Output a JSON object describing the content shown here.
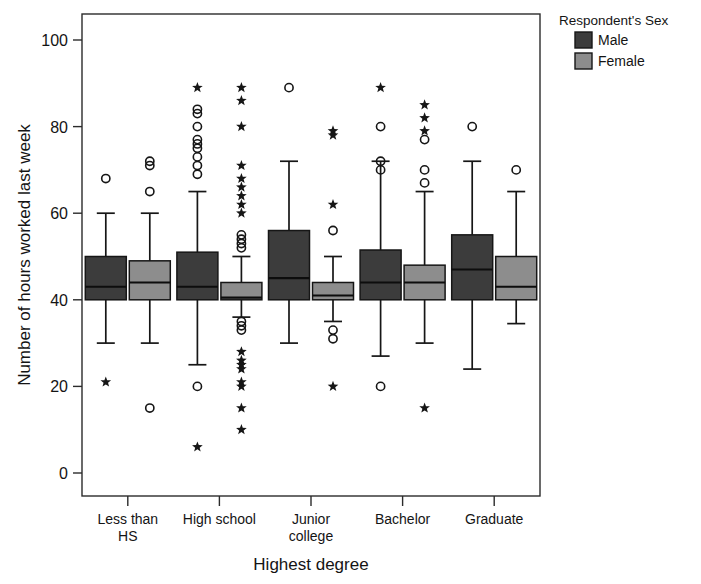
{
  "chart_data": {
    "type": "box",
    "title": "",
    "xlabel": "Highest degree",
    "ylabel": "Number of hours worked last week",
    "categories": [
      "Less than HS",
      "High school",
      "Junior college",
      "Bachelor",
      "Graduate"
    ],
    "category_label_lines": [
      [
        "Less than",
        "HS"
      ],
      [
        "High school"
      ],
      [
        "Junior",
        "college"
      ],
      [
        "Bachelor"
      ],
      [
        "Graduate"
      ]
    ],
    "ylim": [
      0,
      105
    ],
    "yticks": [
      0,
      20,
      40,
      60,
      80,
      100
    ],
    "ytick_labels": [
      "0",
      "20",
      "40",
      "60",
      "80",
      "100"
    ],
    "grid": false,
    "legend": {
      "title": "Respondent's Sex",
      "position": "top-right",
      "entries": [
        {
          "name": "Male",
          "color": "#3c3c3c"
        },
        {
          "name": "Female",
          "color": "#8d8d8d"
        }
      ]
    },
    "series": [
      {
        "name": "Male",
        "color": "#3c3c3c",
        "boxes": [
          {
            "category": "Less than HS",
            "whisker_low": 30,
            "q1": 40,
            "median": 43,
            "q3": 50,
            "whisker_high": 60,
            "outliers": [
              68
            ],
            "extremes": [
              21
            ]
          },
          {
            "category": "High school",
            "whisker_low": 25,
            "q1": 40,
            "median": 43,
            "q3": 51,
            "whisker_high": 65,
            "outliers": [
              84,
              83,
              80,
              77,
              76,
              75,
              73,
              71,
              69,
              20
            ],
            "extremes": [
              89,
              6
            ]
          },
          {
            "category": "Junior college",
            "whisker_low": 30,
            "q1": 40,
            "median": 45,
            "q3": 56,
            "whisker_high": 72,
            "outliers": [
              89
            ],
            "extremes": []
          },
          {
            "category": "Bachelor",
            "whisker_low": 27,
            "q1": 40,
            "median": 44,
            "q3": 51.5,
            "whisker_high": 72,
            "outliers": [
              80,
              72,
              70,
              20
            ],
            "extremes": [
              89
            ]
          },
          {
            "category": "Graduate",
            "whisker_low": 24,
            "q1": 40,
            "median": 47,
            "q3": 55,
            "whisker_high": 72,
            "outliers": [
              80
            ],
            "extremes": []
          }
        ]
      },
      {
        "name": "Female",
        "color": "#8d8d8d",
        "boxes": [
          {
            "category": "Less than HS",
            "whisker_low": 30,
            "q1": 40,
            "median": 44,
            "q3": 49,
            "whisker_high": 60,
            "outliers": [
              72,
              71,
              65,
              15
            ],
            "extremes": []
          },
          {
            "category": "High school",
            "whisker_low": 36,
            "q1": 40,
            "median": 40.5,
            "q3": 44,
            "whisker_high": 50,
            "outliers": [
              55,
              54,
              53,
              52,
              35,
              34,
              33
            ],
            "extremes": [
              89,
              86,
              80,
              71,
              68,
              66,
              64,
              62,
              60,
              28,
              26,
              25,
              24,
              21,
              20,
              15,
              10
            ]
          },
          {
            "category": "Junior college",
            "whisker_low": 35,
            "q1": 40,
            "median": 41,
            "q3": 44,
            "whisker_high": 50,
            "outliers": [
              56,
              33,
              31
            ],
            "extremes": [
              79,
              78,
              62,
              20
            ]
          },
          {
            "category": "Bachelor",
            "whisker_low": 30,
            "q1": 40,
            "median": 44,
            "q3": 48,
            "whisker_high": 65,
            "outliers": [
              77,
              70,
              67
            ],
            "extremes": [
              85,
              82,
              79,
              15
            ]
          },
          {
            "category": "Graduate",
            "whisker_low": 34.5,
            "q1": 40,
            "median": 43,
            "q3": 50,
            "whisker_high": 65,
            "outliers": [
              70
            ],
            "extremes": []
          }
        ]
      }
    ]
  },
  "axes": {
    "ylabel": "Number of hours worked last week",
    "xlabel": "Highest degree"
  },
  "legend": {
    "title": "Respondent's Sex",
    "male_label": "Male",
    "female_label": "Female"
  }
}
